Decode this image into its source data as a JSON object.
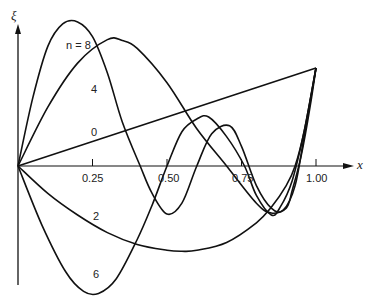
{
  "chart_data": {
    "type": "line",
    "title": "",
    "xlabel": "x",
    "ylabel": "ξ",
    "xlim": [
      0,
      1.1
    ],
    "x_ticks": [
      "0.25",
      "0.50",
      "0.75",
      "1.00"
    ],
    "x_tick_values": [
      0.25,
      0.5,
      0.75,
      1.0
    ],
    "grid": false,
    "legend": "inline curve labels",
    "annotations": [
      "n = 8",
      "4",
      "0",
      "2",
      "6"
    ],
    "series": [
      {
        "name": "0",
        "label": "0",
        "x": [
          0,
          1.0
        ],
        "y": [
          0,
          1.0
        ]
      },
      {
        "name": "2",
        "label": "2",
        "x": [
          0,
          0.1,
          0.2,
          0.3,
          0.4,
          0.5,
          0.55,
          0.6,
          0.7,
          0.8,
          0.85,
          0.9,
          0.93,
          0.96,
          1.0
        ],
        "y": [
          0,
          -0.28,
          -0.5,
          -0.68,
          -0.8,
          -0.86,
          -0.87,
          -0.86,
          -0.78,
          -0.58,
          -0.42,
          -0.2,
          0.0,
          0.35,
          1.0
        ]
      },
      {
        "name": "4",
        "label": "4",
        "x": [
          0,
          0.1,
          0.2,
          0.3,
          0.35,
          0.4,
          0.5,
          0.6,
          0.7,
          0.8,
          0.85,
          0.9,
          0.92,
          0.95,
          0.98,
          1.0
        ],
        "y": [
          0,
          0.6,
          1.05,
          1.29,
          1.28,
          1.2,
          0.85,
          0.38,
          0.0,
          -0.38,
          -0.48,
          -0.43,
          -0.25,
          0.1,
          0.6,
          1.0
        ]
      },
      {
        "name": "6",
        "label": "6",
        "x": [
          0,
          0.08,
          0.16,
          0.22,
          0.27,
          0.33,
          0.4,
          0.45,
          0.5,
          0.55,
          0.6,
          0.64,
          0.7,
          0.76,
          0.8,
          0.85,
          0.88,
          0.92,
          0.96,
          1.0
        ],
        "y": [
          0,
          -0.6,
          -1.08,
          -1.28,
          -1.3,
          -1.15,
          -0.75,
          -0.4,
          0.0,
          0.35,
          0.48,
          0.5,
          0.3,
          0.0,
          -0.3,
          -0.5,
          -0.42,
          -0.15,
          0.35,
          1.0
        ]
      },
      {
        "name": "8",
        "label": "n = 8",
        "x": [
          0,
          0.05,
          0.1,
          0.15,
          0.2,
          0.25,
          0.3,
          0.35,
          0.41,
          0.45,
          0.5,
          0.55,
          0.6,
          0.65,
          0.71,
          0.75,
          0.8,
          0.85,
          0.89,
          0.93,
          0.96,
          1.0
        ],
        "y": [
          0,
          0.7,
          1.22,
          1.45,
          1.47,
          1.32,
          0.95,
          0.45,
          0.0,
          -0.28,
          -0.49,
          -0.38,
          0.0,
          0.33,
          0.41,
          0.2,
          -0.2,
          -0.43,
          -0.45,
          -0.2,
          0.3,
          1.0
        ]
      }
    ]
  },
  "labels": {
    "y_axis": "ξ",
    "x_axis": "x",
    "tick_025": "0.25",
    "tick_050": "0.50",
    "tick_075": "0.75",
    "tick_100": "1.00",
    "curve_8": "n = 8",
    "curve_4": "4",
    "curve_0": "0",
    "curve_2": "2",
    "curve_6": "6"
  },
  "style": {
    "line_color": "#111111",
    "background": "#ffffff"
  }
}
